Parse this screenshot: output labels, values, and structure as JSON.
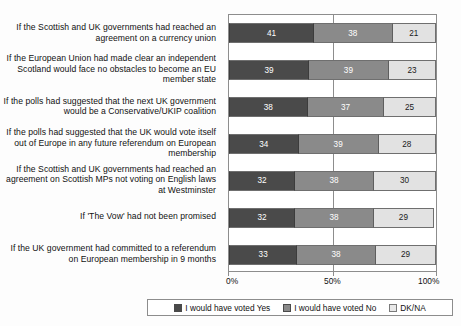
{
  "chart_data": {
    "type": "bar",
    "orientation": "horizontal",
    "stacked": true,
    "stack_mode": "percent",
    "title": "",
    "subtitle": "",
    "xlabel": "",
    "ylabel": "",
    "xlim": [
      0,
      100
    ],
    "grid": false,
    "legend_position": "bottom",
    "axis_ticks": [
      "0%",
      "50%",
      "100%"
    ],
    "axis_tick_values": [
      0,
      50,
      100
    ],
    "categories": [
      "If the Scottish and UK governments had reached an agreement on a currency union",
      "If the European Union had made clear an independent Scotland would face no obstacles to become an EU member state",
      "If the polls had suggested that the next UK government would be a Conservative/UKIP coalition",
      "If the polls had suggested that the UK would vote itself out of Europe in any future referendum on European membership",
      "If the Scottish and UK governments had reached an agreement on Scottish MPs not voting on English laws at Westminster",
      "If 'The Vow' had not been promised",
      "If the UK government had committed to a referendum on European membership in 9 months"
    ],
    "series": [
      {
        "name": "I would have voted Yes",
        "color": "#4a4a4a",
        "values": [
          41,
          39,
          38,
          34,
          32,
          32,
          33
        ]
      },
      {
        "name": "I would have voted No",
        "color": "#8a8a8a",
        "values": [
          38,
          39,
          37,
          39,
          38,
          38,
          38
        ]
      },
      {
        "name": "DK/NA",
        "color": "#e2e2e2",
        "values": [
          21,
          23,
          25,
          28,
          30,
          29,
          29
        ]
      }
    ]
  },
  "legend": {
    "items": [
      {
        "label": "I would have voted Yes",
        "swatch": "k0"
      },
      {
        "label": "I would have voted No",
        "swatch": "k1"
      },
      {
        "label": "DK/NA",
        "swatch": "k2"
      }
    ]
  },
  "caption": ""
}
